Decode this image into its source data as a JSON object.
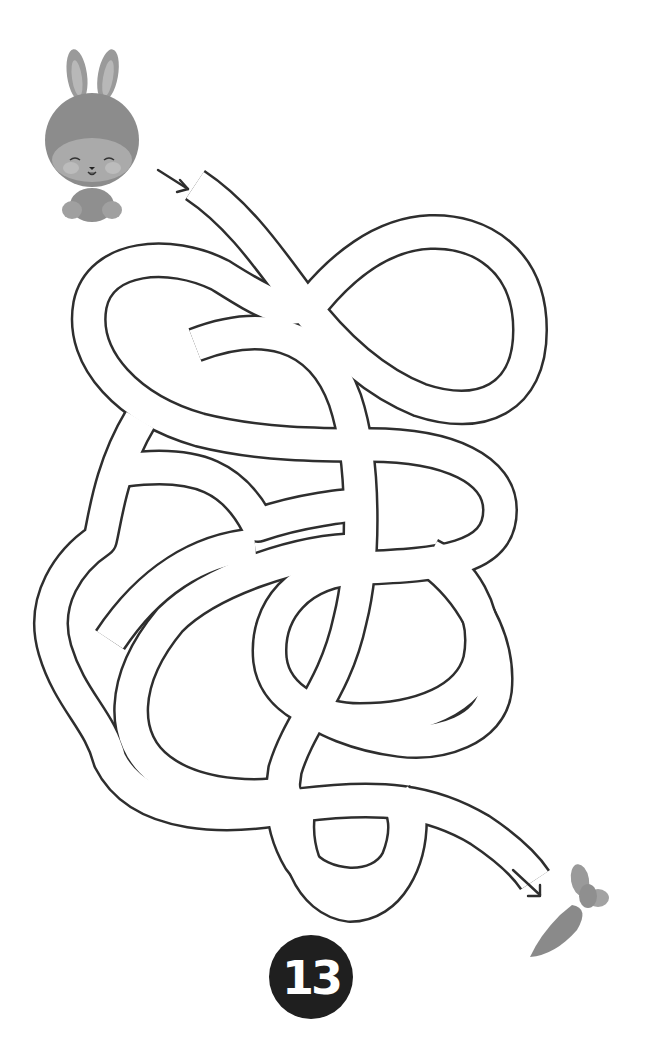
{
  "puzzle": {
    "type": "maze",
    "page_number": "13",
    "start": {
      "character": "bunny",
      "icon": "bunny-icon",
      "arrow": "start-arrow-icon"
    },
    "finish": {
      "item": "carrot",
      "icon": "carrot-icon",
      "arrow": "finish-arrow-icon"
    }
  },
  "colors": {
    "line": "#2e2e2e",
    "background": "#ffffff",
    "badge": "#1f1f1f",
    "badge_text": "#ffffff",
    "bunny_fur": "#8a8a8a",
    "carrot": "#8c8c8c"
  }
}
